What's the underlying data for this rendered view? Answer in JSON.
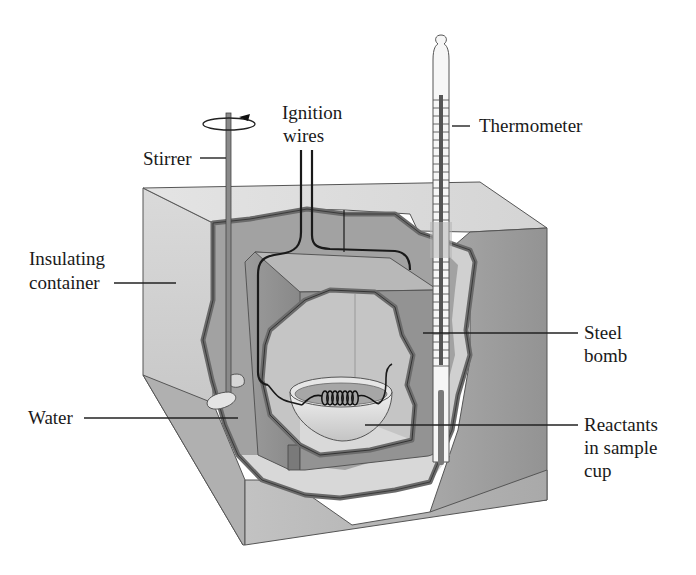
{
  "diagram": {
    "colors": {
      "background": "#ffffff",
      "container_top": "#dedede",
      "container_left": "#d2d2d2",
      "container_right": "#9a9a9a",
      "container_front": "#b9b9b9",
      "water": "#a3a3a3",
      "water_light": "#cfcfcf",
      "wall_outline": "#6f6f6f",
      "bomb_top": "#bdbdbd",
      "bomb_side": "#8e8e8e",
      "bomb_interior": "#c6c6c6",
      "cup": "#e2e2e2",
      "wire": "#1f1f1f",
      "text": "#1a1a1a"
    },
    "labels": {
      "ignition_wires": [
        "Ignition",
        "wires"
      ],
      "stirrer": "Stirrer",
      "thermometer": "Thermometer",
      "insulating_container": [
        "Insulating",
        "container"
      ],
      "steel_bomb": [
        "Steel",
        "bomb"
      ],
      "water": "Water",
      "reactants": [
        "Reactants",
        "in sample",
        "cup"
      ]
    },
    "icons": {
      "rotation_arrow": "counterclockwise-rotation-arrow-icon"
    }
  }
}
